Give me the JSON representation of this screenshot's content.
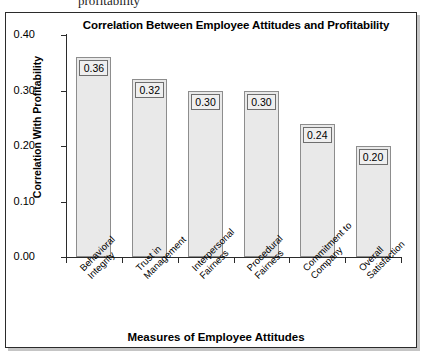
{
  "document_fragment": {
    "text": "profitability"
  },
  "chart_data": {
    "type": "bar",
    "title": "Correlation Between Employee Attitudes and Profitability",
    "xlabel": "Measures of Employee Attitudes",
    "ylabel": "Correlation With Profitability",
    "categories": [
      "Behavioral Integrity",
      "Trust in Management",
      "Interpersonal Fairness",
      "Procedural Fairness",
      "Commitment to Company",
      "Overall Satisfaction"
    ],
    "category_lines": [
      [
        "Behavioral",
        "Integrity"
      ],
      [
        "Trust in",
        "Management"
      ],
      [
        "Interpersonal",
        "Fairness"
      ],
      [
        "Procedural",
        "Fairness"
      ],
      [
        "Commitment to",
        "Company"
      ],
      [
        "Overall",
        "Satisfaction"
      ]
    ],
    "values": [
      0.36,
      0.32,
      0.3,
      0.3,
      0.24,
      0.2
    ],
    "value_labels": [
      "0.36",
      "0.32",
      "0.30",
      "0.30",
      "0.24",
      "0.20"
    ],
    "ylim": [
      0.0,
      0.4
    ],
    "ytick_values": [
      0.4,
      0.3,
      0.2,
      0.1,
      0.0
    ],
    "ytick_labels": [
      "0.40",
      "0.30",
      "0.20",
      "0.10",
      "0.00"
    ],
    "grid": false,
    "legend": false,
    "bar_fill_color": "#e9e9e9",
    "bar_border_color": "#8d8d8d",
    "axis_color": "#2b2b2b"
  }
}
